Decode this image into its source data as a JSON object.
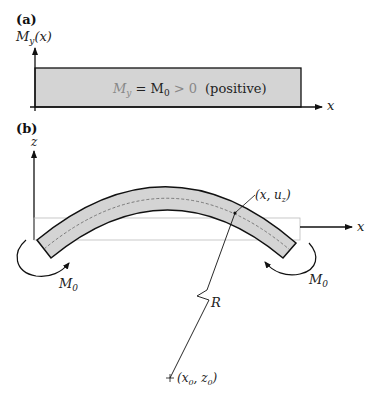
{
  "panel_a": {
    "tag": "(a)",
    "y_axis_label_main": "M",
    "y_axis_label_sub": "y",
    "y_axis_label_arg": "(x)",
    "x_axis_label": "x",
    "region_label_main": "M",
    "region_label_sub": "y",
    "region_label_eq": " = M",
    "region_label_sub0": "0",
    "region_label_gt": " > 0",
    "region_label_note": "(positive)"
  },
  "panel_b": {
    "tag": "(b)",
    "z_axis_label": "z",
    "x_axis_label": "x",
    "point_label": "(x, u",
    "point_label_sub": "z",
    "point_label_close": ")",
    "left_moment_main": "M",
    "left_moment_sub": "0",
    "right_moment_main": "M",
    "right_moment_sub": "0",
    "radius_label": "R",
    "center_label": "(x",
    "center_label_sub1": "0",
    "center_label_mid": ", z",
    "center_label_sub2": "0",
    "center_label_close": ")"
  },
  "colors": {
    "fill": "#d4d4d4",
    "stroke": "#111111",
    "faint": "#b8b8b8"
  }
}
